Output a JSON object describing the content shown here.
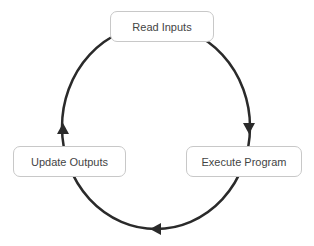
{
  "diagram": {
    "type": "cycle",
    "direction": "clockwise",
    "nodes": [
      {
        "id": "read",
        "label": "Read Inputs",
        "position": "top"
      },
      {
        "id": "execute",
        "label": "Execute Program",
        "position": "right"
      },
      {
        "id": "update",
        "label": "Update Outputs",
        "position": "left"
      }
    ],
    "edges": [
      {
        "from": "read",
        "to": "execute"
      },
      {
        "from": "execute",
        "to": "update"
      },
      {
        "from": "update",
        "to": "read"
      }
    ],
    "colors": {
      "stroke": "#2a2a2a",
      "box_border": "#c8c8c8",
      "text": "#444444",
      "background": "#ffffff"
    }
  }
}
